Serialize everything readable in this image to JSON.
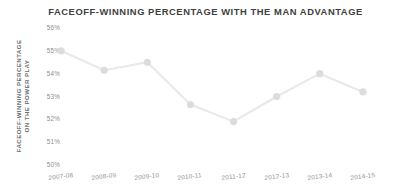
{
  "chart_data": {
    "type": "line",
    "title": "FACEOFF-WINNING PERCENTAGE WITH THE MAN ADVANTAGE",
    "xlabel": "",
    "ylabel": "FACEOFF-WINNING PERCENTAGE ON THE POWER PLAY",
    "ylabel_line1": "FACEOFF-WINNING PERCENTAGE",
    "ylabel_line2": "ON THE POWER PLAY",
    "categories": [
      "2007-08",
      "2008-09",
      "2009-10",
      "2010-11",
      "2011-12",
      "2012-13",
      "2013-14",
      "2014-15"
    ],
    "values": [
      55.0,
      54.15,
      54.5,
      52.65,
      51.9,
      53.0,
      54.0,
      53.2
    ],
    "ylim": [
      50,
      56
    ],
    "ytick_labels": [
      "56%",
      "55%",
      "54%",
      "53%",
      "52%",
      "51%",
      "50%"
    ],
    "ytick_values": [
      56,
      55,
      54,
      53,
      52,
      51,
      50
    ],
    "grid": false,
    "legend": "none",
    "line_color": "#e8e8e8",
    "marker_color": "#dcdcdc",
    "background_color": "#ffffff",
    "text_color": "#8e8e91",
    "title_color": "#3f3f41"
  }
}
